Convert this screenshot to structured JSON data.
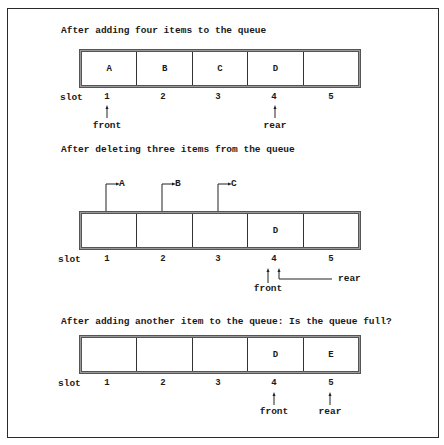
{
  "figure": {
    "slot_label": "slot",
    "slot_numbers": [
      "1",
      "2",
      "3",
      "4",
      "5"
    ],
    "panels": [
      {
        "title": "After adding four items to the queue",
        "cells": [
          "A",
          "B",
          "C",
          "D",
          ""
        ],
        "front_label": "front",
        "rear_label": "rear",
        "front_slot": 1,
        "rear_slot": 4
      },
      {
        "title": "After deleting three items from the queue",
        "cells": [
          "",
          "",
          "",
          "D",
          ""
        ],
        "removed_items": [
          "A",
          "B",
          "C"
        ],
        "front_label": "front",
        "rear_label": "rear",
        "front_slot": 4,
        "rear_slot": 4
      },
      {
        "title": "After adding another item to the queue: Is the queue full?",
        "cells": [
          "",
          "",
          "",
          "D",
          "E"
        ],
        "front_label": "front",
        "rear_label": "rear",
        "front_slot": 4,
        "rear_slot": 5
      }
    ]
  }
}
